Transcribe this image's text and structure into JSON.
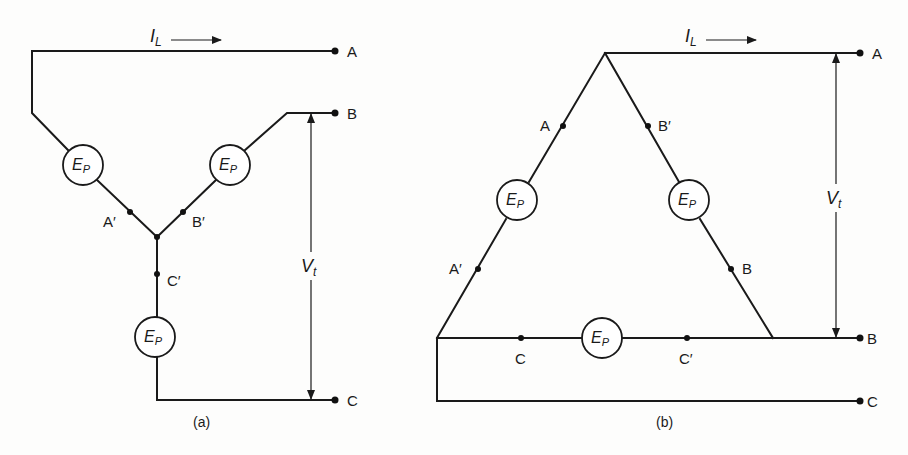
{
  "figure": {
    "diagram_a": {
      "caption": "(a)",
      "connection": "wye",
      "current_label": {
        "main": "I",
        "sub": "L"
      },
      "voltage_label": {
        "main": "V",
        "sub": "t"
      },
      "terminals": [
        "A",
        "B",
        "C"
      ],
      "winding_nodes": [
        "A′",
        "B′",
        "C′"
      ],
      "sources": [
        {
          "main": "E",
          "sub": "P"
        },
        {
          "main": "E",
          "sub": "P"
        },
        {
          "main": "E",
          "sub": "P"
        }
      ]
    },
    "diagram_b": {
      "caption": "(b)",
      "connection": "delta",
      "current_label": {
        "main": "I",
        "sub": "L"
      },
      "voltage_label": {
        "main": "V",
        "sub": "t"
      },
      "terminals": [
        "A",
        "B",
        "C"
      ],
      "winding_nodes": [
        "A",
        "A′",
        "B′",
        "B",
        "C",
        "C′"
      ],
      "sources": [
        {
          "main": "E",
          "sub": "P"
        },
        {
          "main": "E",
          "sub": "P"
        },
        {
          "main": "E",
          "sub": "P"
        }
      ]
    }
  }
}
